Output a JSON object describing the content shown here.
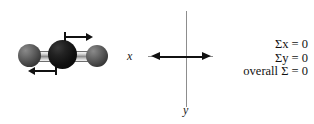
{
  "figure": {
    "background_color": "#ffffff",
    "width": 314,
    "height": 124
  },
  "molecule": {
    "description": "linear triatomic molecule asymmetric stretch",
    "atoms": [
      {
        "name": "atom-left",
        "color": "#4a4a4a",
        "type": "gray-sphere"
      },
      {
        "name": "atom-center",
        "color": "#101010",
        "type": "black-sphere"
      },
      {
        "name": "atom-right",
        "color": "#4a4a4a",
        "type": "gray-sphere"
      }
    ],
    "bonds": [
      {
        "name": "bond-left",
        "color": "#8e8e8e"
      },
      {
        "name": "bond-right",
        "color": "#8e8e8e"
      }
    ],
    "vibration_arrows": [
      {
        "name": "vibration-arrow-top",
        "direction": "right",
        "color": "#111111"
      },
      {
        "name": "vibration-arrow-bottom",
        "direction": "left",
        "color": "#111111"
      }
    ]
  },
  "axes": {
    "x_label": "x",
    "y_label": "y",
    "x_arrow": "double-headed-horizontal",
    "x_arrow_color": "#111111",
    "axis_line_color": "#8d8d8d"
  },
  "equations": {
    "lines": [
      {
        "text": "Σx = 0",
        "label": "sum-x-equals-zero"
      },
      {
        "text": "Σy = 0",
        "label": "sum-y-equals-zero"
      },
      {
        "text": "overall Σ = 0",
        "label": "overall-sum-equals-zero"
      }
    ]
  }
}
